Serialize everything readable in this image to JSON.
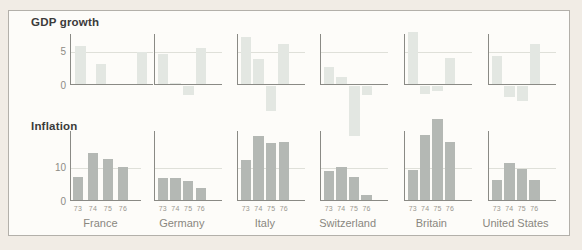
{
  "frame": {
    "page_bg": "#f1ece5",
    "panel_bg": "#fdfcf9",
    "border_color": "#b3b0aa"
  },
  "row_titles": {
    "gdp": "GDP growth",
    "inflation": "Inflation"
  },
  "axis": {
    "line_color": "#8a8a85",
    "grid_color": "#dfe0d9",
    "tick_color": "#8d8b85",
    "year_color": "#9a978f",
    "country_color": "#8a8780"
  },
  "chart_data": [
    {
      "type": "bar",
      "title": "GDP growth",
      "categories": [
        "73",
        "74",
        "75",
        "76"
      ],
      "series": [
        {
          "name": "France",
          "values": [
            5.8,
            3.1,
            0,
            5.0
          ]
        },
        {
          "name": "Germany",
          "values": [
            4.6,
            0.3,
            -1.4,
            5.5
          ]
        },
        {
          "name": "Italy",
          "values": [
            7.2,
            3.9,
            -3.8,
            6.1
          ]
        },
        {
          "name": "Switzerland",
          "values": [
            2.7,
            1.2,
            -7.5,
            -1.4
          ]
        },
        {
          "name": "Britain",
          "values": [
            7.9,
            -1.2,
            -0.8,
            4.0
          ]
        },
        {
          "name": "United States",
          "values": [
            4.4,
            -1.6,
            -2.2,
            6.1
          ]
        }
      ],
      "yticks": [
        {
          "value": 5,
          "label": "5"
        },
        {
          "value": 0,
          "label": "0"
        }
      ],
      "gridline_value": 5,
      "ylim": [
        -8,
        8
      ],
      "bar_color": "#e3e7e2",
      "show_year_labels": false,
      "show_country_labels": false,
      "legend": "none",
      "grid": "single horizontal line at y=5, first panel only has y tick labels"
    },
    {
      "type": "bar",
      "title": "Inflation",
      "categories": [
        "73",
        "74",
        "75",
        "76"
      ],
      "series": [
        {
          "name": "France",
          "values": [
            7.2,
            14.5,
            12.5,
            10.3
          ]
        },
        {
          "name": "Germany",
          "values": [
            7.0,
            7.0,
            5.9,
            4.0
          ]
        },
        {
          "name": "Italy",
          "values": [
            12.4,
            19.5,
            17.5,
            17.8
          ]
        },
        {
          "name": "Switzerland",
          "values": [
            8.9,
            10.2,
            7.2,
            1.9
          ]
        },
        {
          "name": "Britain",
          "values": [
            9.2,
            19.7,
            24.7,
            17.7
          ]
        },
        {
          "name": "United States",
          "values": [
            6.3,
            11.5,
            9.5,
            6.3
          ]
        }
      ],
      "yticks": [
        {
          "value": 10,
          "label": "10"
        },
        {
          "value": 0,
          "label": "0"
        }
      ],
      "gridline_value": 10,
      "ylim": [
        0,
        25
      ],
      "bar_color": "#b4b8b4",
      "show_year_labels": true,
      "show_country_labels": true,
      "legend": "none",
      "grid": "single horizontal line at y=10, first panel only has y tick labels"
    }
  ]
}
